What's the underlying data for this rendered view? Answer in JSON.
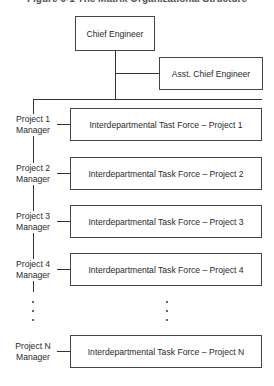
{
  "figure": {
    "title": "Figure 6-1  The Matrix Organizational Structure",
    "chief": "Chief Engineer",
    "asst": "Asst. Chief Engineer",
    "projects": [
      {
        "manager_line1": "Project 1",
        "manager_line2": "Manager",
        "task_force": "Interdepartmental Tast Force – Project 1"
      },
      {
        "manager_line1": "Project 2",
        "manager_line2": "Manager",
        "task_force": "Interdepartmental Task Force – Project 2"
      },
      {
        "manager_line1": "Project 3",
        "manager_line2": "Manager",
        "task_force": "Interdepartmental Task Force – Project 3"
      },
      {
        "manager_line1": "Project 4",
        "manager_line2": "Manager",
        "task_force": "Interdepartmental Task Force – Project 4"
      },
      {
        "manager_line1": "Project N",
        "manager_line2": "Manager",
        "task_force": "Interdepartmental Task Force – Project N"
      }
    ]
  }
}
